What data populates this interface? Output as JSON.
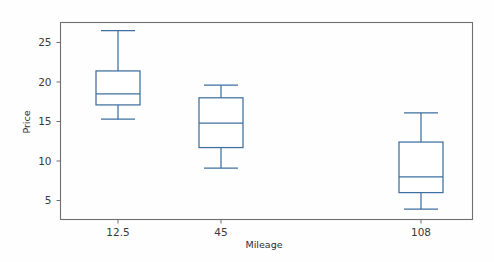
{
  "chart_data": {
    "type": "box",
    "title": "",
    "xlabel": "Mileage",
    "ylabel": "Price",
    "categories": [
      "12.5",
      "45",
      "108"
    ],
    "ytick_labels": [
      "25",
      "20",
      "15",
      "10",
      "5"
    ],
    "ytick_values": [
      25,
      20,
      15,
      10,
      5
    ],
    "ylim": [
      2.7,
      27.4
    ],
    "grid": false,
    "legend": null,
    "box_color": "#3f6f9f",
    "line_color": "#3f6f9f",
    "fill_color": "#ffffff",
    "frame_color": "#6e6e6e",
    "boxes": [
      {
        "category": "12.5",
        "whisker_low": 15.3,
        "q1": 17.1,
        "median": 18.5,
        "q3": 21.4,
        "whisker_high": 26.5
      },
      {
        "category": "45",
        "whisker_low": 9.1,
        "q1": 11.7,
        "median": 14.8,
        "q3": 18.0,
        "whisker_high": 19.6
      },
      {
        "category": "108",
        "whisker_low": 3.9,
        "q1": 6.0,
        "median": 8.0,
        "q3": 12.4,
        "whisker_high": 16.1
      }
    ]
  }
}
